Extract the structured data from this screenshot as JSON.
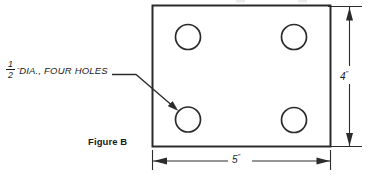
{
  "figure": {
    "caption": "Figure B",
    "shape": {
      "name": "rectangular-plate",
      "stroke_color": "#2b2b2b"
    },
    "callout": {
      "fraction_numerator": "1",
      "fraction_denominator": "2",
      "inch_mark": "\"",
      "text": "DIA., FOUR HOLES"
    },
    "dimensions": {
      "width": {
        "value": "5",
        "unit": "\"",
        "label": "5\""
      },
      "height": {
        "value": "4",
        "unit": "\"",
        "label": "4\""
      }
    },
    "holes": {
      "count": 4,
      "diameter_label": "1/2\""
    }
  }
}
